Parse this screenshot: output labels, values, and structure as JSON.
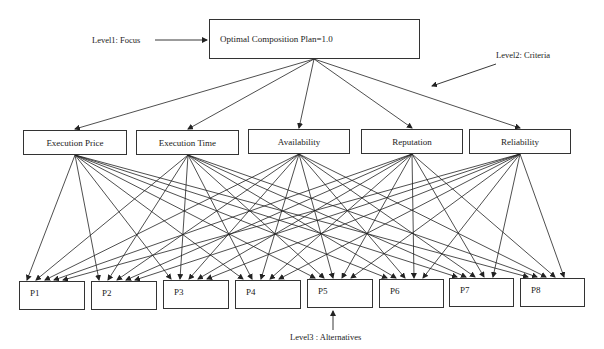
{
  "diagram": {
    "type": "AHP hierarchy",
    "labels": {
      "level1": "Level1: Focus",
      "level2": "Level2: Criteria",
      "level3": "Level3 : Alternatives"
    },
    "focus": "Optimal Composition Plan=1.0",
    "criteria": [
      "Execution Price",
      "Execution Time",
      "Availability",
      "Reputation",
      "Reliability"
    ],
    "alternatives": [
      "P1",
      "P2",
      "P3",
      "P4",
      "P5",
      "P6",
      "P7",
      "P8"
    ],
    "edges": "focus connects to all 5 criteria; each criterion connects to all 8 alternatives"
  }
}
